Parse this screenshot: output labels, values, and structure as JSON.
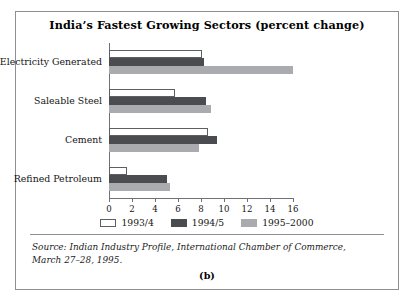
{
  "figure": {
    "caption": "(b)",
    "source": "Source: Indian Industry Profile, International Chamber of Commerce, March 27–28, 1995."
  },
  "chart_data": {
    "type": "bar",
    "orientation": "horizontal",
    "title": "India’s Fastest Growing Sectors (percent change)",
    "xlabel": "",
    "ylabel": "",
    "xlim": [
      0,
      16
    ],
    "xticks": [
      0,
      2,
      4,
      6,
      8,
      10,
      12,
      14,
      16
    ],
    "grid": false,
    "legend_position": "bottom",
    "categories": [
      "Electricity Generated",
      "Saleable Steel",
      "Cement",
      "Refined Petroleum"
    ],
    "series": [
      {
        "name": "1993/4",
        "color": "#ffffff",
        "values": [
          8.1,
          5.7,
          8.6,
          1.6
        ]
      },
      {
        "name": "1994/5",
        "color": "#4a4c50",
        "values": [
          8.3,
          8.4,
          9.4,
          5.0
        ]
      },
      {
        "name": "1995–2000",
        "color": "#a9abaf",
        "values": [
          16.0,
          8.9,
          7.8,
          5.3
        ]
      }
    ]
  }
}
